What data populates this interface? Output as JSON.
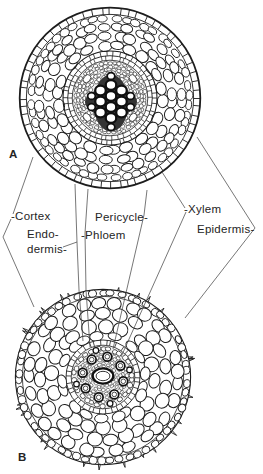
{
  "figure": {
    "type": "plant-root-cross-section-comparison",
    "panels": [
      {
        "letter": "A"
      },
      {
        "letter": "B"
      }
    ],
    "labels": {
      "cortex": "-Cortex",
      "endodermis_line1": "Endo-",
      "endodermis_line2": "dermis-",
      "pericycle": "Pericycle-",
      "phloem": "-Phloem",
      "xylem": "-Xylem",
      "epidermis": "Epidermis-"
    },
    "colors": {
      "ink": "#1d1d1d",
      "leader": "#4a4a4a",
      "background": "#ffffff",
      "stele_shade": "#f1f1f1",
      "xylem_dark": "#343434"
    }
  }
}
